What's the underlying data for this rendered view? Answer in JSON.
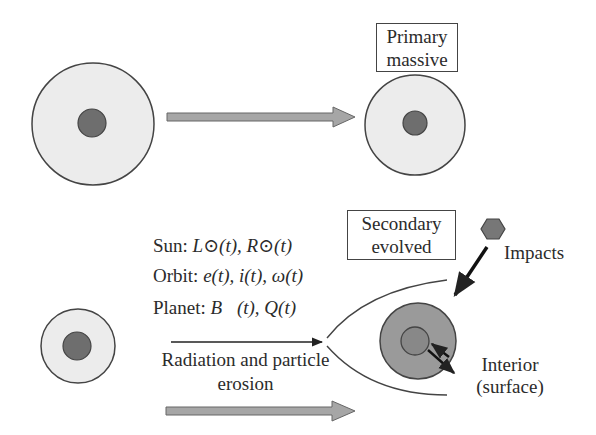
{
  "top_row": {
    "primary_label": {
      "line1": "Primary",
      "line2": "massive"
    }
  },
  "bottom_row": {
    "secondary_label": {
      "line1": "Secondary",
      "line2": "evolved"
    },
    "parameters": {
      "sun": {
        "prefix": "Sun: ",
        "text": "L⊙(t), R⊙(t)"
      },
      "orbit": {
        "prefix": "Orbit: ",
        "text": "e(t), i(t), ω(t)"
      },
      "planet": {
        "prefix": "Planet: ",
        "text": "B⃗(t), Q(t)"
      }
    },
    "erosion_label": {
      "line1": "Radiation and particle",
      "line2": "erosion"
    },
    "impacts_label": "Impacts",
    "interior_label": {
      "line1": "Interior",
      "line2": "(surface)"
    }
  },
  "colors": {
    "mantle_light": "#ececec",
    "core_dark": "#6e6e6e",
    "mantle_evolved": "#9a9a9a",
    "core_evolved": "#888888",
    "arrow_fill": "#a6a6a6",
    "outline": "#444444",
    "impactor": "#777777"
  }
}
